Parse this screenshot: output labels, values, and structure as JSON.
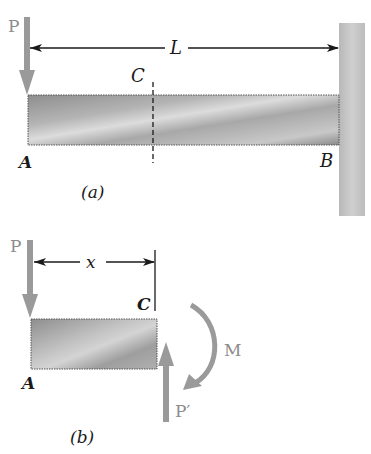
{
  "figure_a": {
    "caption": "(a)",
    "load_label": "P",
    "length_label": "L",
    "section_label": "C",
    "left_end_label": "A",
    "right_end_label": "B"
  },
  "figure_b": {
    "caption": "(b)",
    "load_label": "P",
    "distance_label": "x",
    "section_label": "C",
    "left_end_label": "A",
    "moment_label": "M",
    "reaction_label": "P′"
  },
  "colors": {
    "arrow_gray": "#9a9a9a",
    "beam_dark": "#8a8a8a",
    "beam_light": "#d6d6d6",
    "wall": "#c4c4c4",
    "label_gray": "#8c8c8c",
    "ink": "#1a1a1a"
  }
}
